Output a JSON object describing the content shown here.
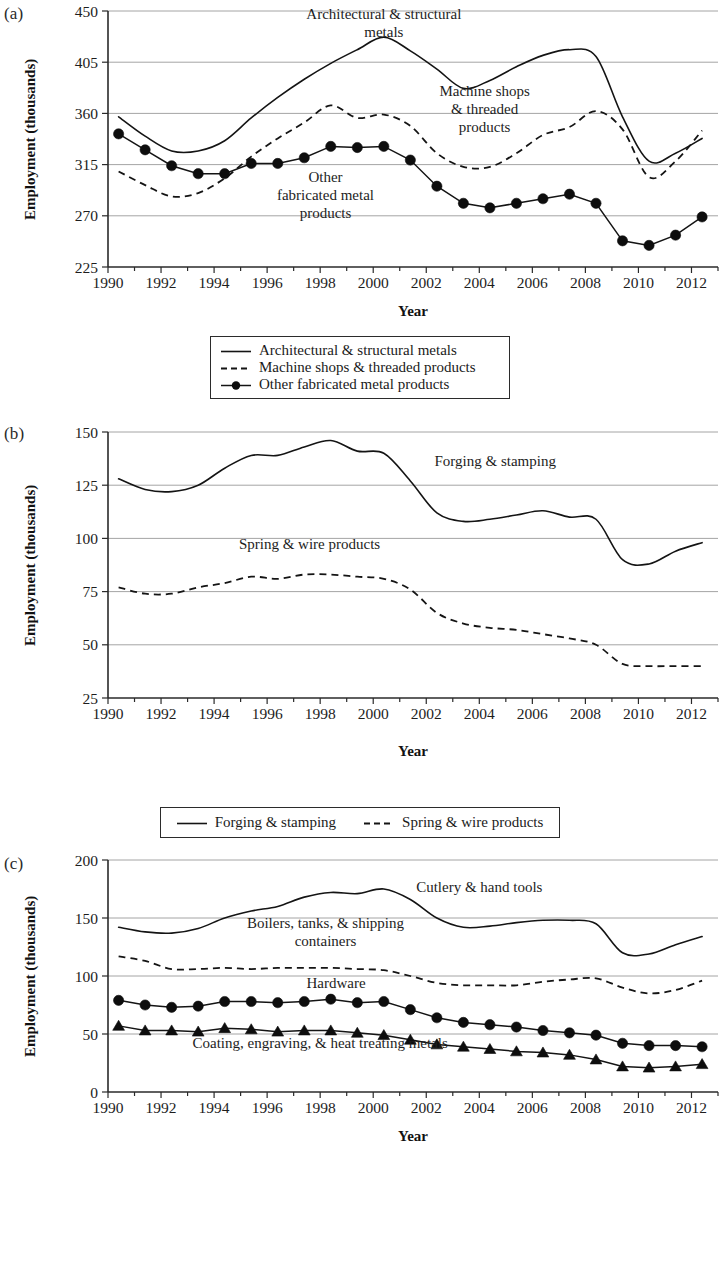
{
  "figure": {
    "panels": [
      "(a)",
      "(b)",
      "(c)"
    ],
    "axis_titles": {
      "x": "Year",
      "y": "Employment (thousands)"
    }
  },
  "chart_data": [
    {
      "id": "a",
      "type": "line",
      "panel_label": "(a)",
      "title": "",
      "xlabel": "Year",
      "ylabel": "Employment (thousands)",
      "xlim": [
        1990,
        2013
      ],
      "ylim": [
        225,
        450
      ],
      "yticks": [
        225,
        270,
        315,
        360,
        405,
        450
      ],
      "xticks": [
        1990,
        1992,
        1994,
        1996,
        1998,
        2000,
        2002,
        2004,
        2006,
        2008,
        2010,
        2012
      ],
      "grid": true,
      "legend_position": "below",
      "annotations": [
        {
          "text": [
            "Architectural & structural",
            "metals"
          ],
          "x": 2000.4,
          "y": 443
        },
        {
          "text": [
            "Machine shops",
            "& threaded",
            "products"
          ],
          "x": 2004.2,
          "y": 375
        },
        {
          "text": [
            "Other",
            "fabricated metal",
            "products"
          ],
          "x": 1998.2,
          "y": 300
        }
      ],
      "x": [
        1990.4,
        1991.4,
        1992.4,
        1993.4,
        1994.4,
        1995.4,
        1996.4,
        1997.4,
        1998.4,
        1999.4,
        2000.4,
        2001.4,
        2002.4,
        2003.4,
        2004.4,
        2005.4,
        2006.4,
        2007.4,
        2008.4,
        2009.4,
        2010.4,
        2011.4,
        2012.4
      ],
      "series": [
        {
          "name": "Architectural & structural metals",
          "style": "solid",
          "marker": "none",
          "values": [
            357,
            340,
            327,
            327,
            336,
            356,
            374,
            390,
            404,
            416,
            427,
            415,
            399,
            382,
            389,
            401,
            411,
            416,
            410,
            357,
            318,
            325,
            338
          ]
        },
        {
          "name": "Machine shops & threaded products",
          "style": "dashed",
          "marker": "none",
          "values": [
            309,
            297,
            287,
            290,
            303,
            322,
            338,
            352,
            367,
            356,
            359,
            349,
            325,
            313,
            313,
            325,
            341,
            348,
            362,
            346,
            304,
            318,
            345
          ]
        },
        {
          "name": "Other fabricated metal products",
          "style": "solid",
          "marker": "circle",
          "values": [
            342,
            328,
            314,
            307,
            307,
            316,
            316,
            321,
            331,
            330,
            331,
            319,
            296,
            281,
            277,
            281,
            285,
            289,
            281,
            248,
            244,
            253,
            269
          ]
        }
      ]
    },
    {
      "id": "b",
      "type": "line",
      "panel_label": "(b)",
      "title": "",
      "xlabel": "Year",
      "ylabel": "Employment (thousands)",
      "xlim": [
        1990,
        2013
      ],
      "ylim": [
        25,
        150
      ],
      "yticks": [
        25,
        50,
        75,
        100,
        125,
        150
      ],
      "xticks": [
        1990,
        1992,
        1994,
        1996,
        1998,
        2000,
        2002,
        2004,
        2006,
        2008,
        2010,
        2012
      ],
      "grid": true,
      "legend_position": "below",
      "annotations": [
        {
          "text": [
            "Forging & stamping"
          ],
          "x": 2004.6,
          "y": 134
        },
        {
          "text": [
            "Spring & wire products"
          ],
          "x": 1997.6,
          "y": 95
        }
      ],
      "x": [
        1990.4,
        1991.4,
        1992.4,
        1993.4,
        1994.4,
        1995.4,
        1996.4,
        1997.4,
        1998.4,
        1999.4,
        2000.4,
        2001.4,
        2002.4,
        2003.4,
        2004.4,
        2005.4,
        2006.4,
        2007.4,
        2008.4,
        2009.4,
        2010.4,
        2011.4,
        2012.4
      ],
      "series": [
        {
          "name": "Forging & stamping",
          "style": "solid",
          "marker": "none",
          "values": [
            128,
            123,
            122,
            125,
            133,
            139,
            139,
            143,
            146,
            141,
            140,
            127,
            112,
            108,
            109,
            111,
            113,
            110,
            109,
            90,
            88,
            94,
            98
          ]
        },
        {
          "name": "Spring & wire products",
          "style": "dashed",
          "marker": "none",
          "values": [
            77,
            74,
            74,
            77,
            79,
            82,
            81,
            83,
            83,
            82,
            81,
            76,
            65,
            60,
            58,
            57,
            55,
            53,
            50,
            41,
            40,
            40,
            40
          ]
        }
      ]
    },
    {
      "id": "c",
      "type": "line",
      "panel_label": "(c)",
      "title": "",
      "xlabel": "Year",
      "ylabel": "Employment (thousands)",
      "xlim": [
        1990,
        2013
      ],
      "ylim": [
        0,
        200
      ],
      "yticks": [
        0,
        50,
        100,
        150,
        200
      ],
      "xticks": [
        1990,
        1992,
        1994,
        1996,
        1998,
        2000,
        2002,
        2004,
        2006,
        2008,
        2010,
        2012
      ],
      "grid": true,
      "legend_position": "below",
      "annotations": [
        {
          "text": [
            "Cutlery & hand tools"
          ],
          "x": 2004.0,
          "y": 172
        },
        {
          "text": [
            "Boilers, tanks, & shipping",
            "containers"
          ],
          "x": 1998.2,
          "y": 141
        },
        {
          "text": [
            "Hardware"
          ],
          "x": 1998.6,
          "y": 90
        },
        {
          "text": [
            "Coating, engraving, & heat treating metals"
          ],
          "x": 1998.0,
          "y": 38
        }
      ],
      "x": [
        1990.4,
        1991.4,
        1992.4,
        1993.4,
        1994.4,
        1995.4,
        1996.4,
        1997.4,
        1998.4,
        1999.4,
        2000.4,
        2001.4,
        2002.4,
        2003.4,
        2004.4,
        2005.4,
        2006.4,
        2007.4,
        2008.4,
        2009.4,
        2010.4,
        2011.4,
        2012.4
      ],
      "series": [
        {
          "name": "Coating, engraving, & heat treating metals",
          "style": "solid",
          "marker": "none",
          "values": [
            142,
            138,
            137,
            141,
            150,
            156,
            160,
            168,
            172,
            171,
            175,
            166,
            150,
            142,
            143,
            146,
            148,
            148,
            145,
            120,
            119,
            127,
            134
          ]
        },
        {
          "name": "Boilers, tanks, & shipping containers",
          "style": "dashed",
          "marker": "none",
          "values": [
            117,
            113,
            106,
            106,
            107,
            106,
            107,
            107,
            107,
            106,
            105,
            100,
            94,
            92,
            92,
            92,
            95,
            97,
            98,
            90,
            85,
            88,
            96
          ]
        },
        {
          "name": "Cutlery & hand tools",
          "style": "solid",
          "marker": "circle",
          "values": [
            79,
            75,
            73,
            74,
            78,
            78,
            77,
            78,
            80,
            77,
            78,
            71,
            64,
            60,
            58,
            56,
            53,
            51,
            49,
            42,
            40,
            40,
            39
          ]
        },
        {
          "name": "Hardware",
          "style": "solid",
          "marker": "triangle",
          "values": [
            57,
            53,
            53,
            52,
            55,
            54,
            52,
            53,
            53,
            51,
            49,
            45,
            41,
            39,
            37,
            35,
            34,
            32,
            28,
            22,
            21,
            22,
            24
          ]
        }
      ]
    }
  ],
  "legends": {
    "a": {
      "entries": [
        {
          "label": "Architectural & structural metals",
          "key": "solid-line"
        },
        {
          "label": "Machine shops & threaded products",
          "key": "dashed-line"
        },
        {
          "label": "Other fabricated metal products",
          "key": "circle-line"
        }
      ]
    },
    "b": {
      "entries": [
        {
          "label": "Forging & stamping",
          "key": "solid-line"
        },
        {
          "label": "Spring & wire products",
          "key": "dashed-line"
        }
      ]
    },
    "c": {
      "entries": [
        {
          "label": "Cutlery & hand tools",
          "key": "circle-line"
        },
        {
          "label": "Boilers, tanks, & shipping containers",
          "key": "dashed-line"
        },
        {
          "label": "Hardware",
          "key": "triangle-line"
        },
        {
          "label": "Coating, engraving, & heat treating metals",
          "key": "solid-line"
        }
      ]
    }
  }
}
